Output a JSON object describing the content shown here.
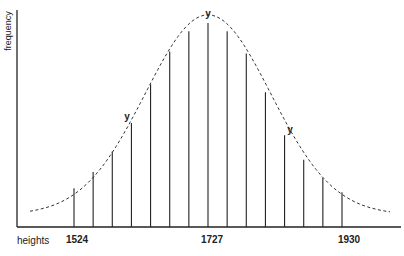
{
  "chart_data": {
    "type": "bar",
    "subtype": "normal-distribution-lines-with-dashed-curve",
    "title": "",
    "xlabel": "heights",
    "ylabel": "frequency",
    "x": [
      1524,
      1553,
      1582,
      1611,
      1640,
      1669,
      1698,
      1727,
      1756,
      1785,
      1814,
      1843,
      1872,
      1901,
      1930
    ],
    "values": [
      19,
      27,
      37,
      51,
      70,
      86,
      96,
      100,
      96,
      85,
      66,
      45,
      33,
      24,
      17
    ],
    "value_units": "relative frequency (peak = 100), estimated",
    "xticks": [
      {
        "value": 1524,
        "label": "1524"
      },
      {
        "value": 1727,
        "label": "1727"
      },
      {
        "value": 1930,
        "label": "1930"
      }
    ],
    "annotations": [
      {
        "label": "y",
        "at_x": 1611,
        "position": "left shoulder"
      },
      {
        "label": "y",
        "at_x": 1727,
        "position": "peak"
      },
      {
        "label": "y",
        "at_x": 1843,
        "position": "right shoulder"
      }
    ],
    "curve": {
      "style": "dashed",
      "shape": "bell / normal distribution envelope"
    },
    "grid": false,
    "legend": null
  },
  "labels": {
    "ylabel": "frequency",
    "xlabel": "heights",
    "tick_1524": "1524",
    "tick_1727": "1727",
    "tick_1930": "1930",
    "ann_left": "y",
    "ann_peak": "y",
    "ann_right": "y"
  },
  "colors": {
    "ink": "#222222",
    "background": "#ffffff"
  }
}
